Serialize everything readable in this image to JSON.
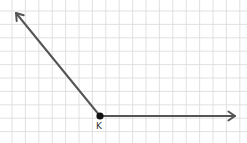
{
  "diagram": {
    "type": "angle",
    "background": "#ffffff",
    "grid": {
      "spacing": 13.4,
      "offset_x": 12,
      "offset_y": 11,
      "color": "#d9d9d9"
    },
    "vertex": {
      "label": "K",
      "x": 100,
      "y": 116,
      "color": "#111111"
    },
    "rays": [
      {
        "name": "ray-up-left",
        "to_x": 16,
        "to_y": 13,
        "color": "#555555"
      },
      {
        "name": "ray-right",
        "to_x": 235,
        "to_y": 116,
        "color": "#555555"
      }
    ]
  }
}
